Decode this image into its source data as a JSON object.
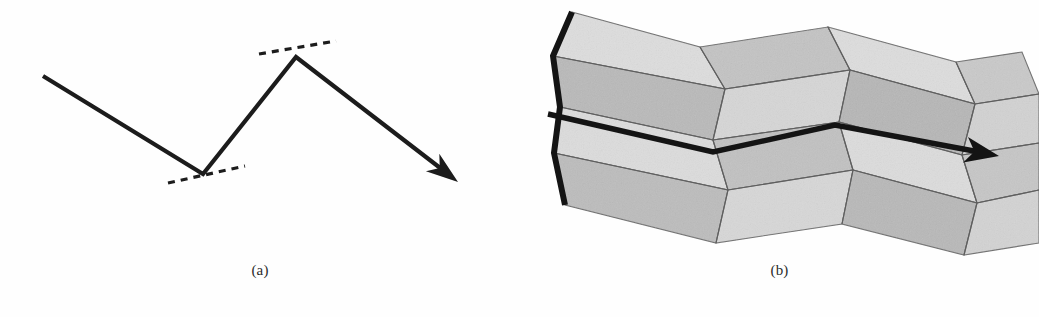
{
  "figure": {
    "kind": "two-panel line drawing",
    "background_color": "#fefefe",
    "ink_color": "#1c1c1c",
    "width": 1039,
    "height": 317
  },
  "panels": [
    {
      "id": "a",
      "caption": "(a)",
      "description": "zig-zag polyline with dashed tangent marks at the two fold vertices and an arrowhead at the right end",
      "stroke_color": "#1c1c1c",
      "stroke_width": 4,
      "polyline_points": "43,76 203,174 296,57 452,177",
      "vertices": [
        {
          "name": "start",
          "x": 43,
          "y": 76
        },
        {
          "name": "valley-fold",
          "x": 203,
          "y": 174
        },
        {
          "name": "mountain-fold",
          "x": 296,
          "y": 57
        },
        {
          "name": "arrow-tip",
          "x": 458,
          "y": 182
        }
      ],
      "dashed_marks": [
        {
          "name": "valley-tangent",
          "x1": 168,
          "y1": 182,
          "x2": 242,
          "y2": 167,
          "dash": "7 6"
        },
        {
          "name": "peak-tangent",
          "x1": 261,
          "y1": 53,
          "x2": 334,
          "y2": 42,
          "dash": "7 6"
        }
      ],
      "arrowhead": {
        "length": 30,
        "half_width": 11
      }
    },
    {
      "id": "b",
      "caption": "(b)",
      "description": "shaded Miura-ori folded sheet, four rows of parallelogram facets, bold zig-zag crease on the left edge and a bold folded arrow running left to right through the middle",
      "facet_fill_light": "#dcdcdc",
      "facet_fill_mid": "#cacaca",
      "facet_fill_dark": "#b4b4b4",
      "facet_stroke": "#6d6d6d",
      "facet_stroke_width": 1.1,
      "bold_line_color": "#141414",
      "bold_line_width": 6,
      "left_zigzag_points": "572,12 553,67 576,114 553,152 575,210",
      "middle_arrow_points": "548,114 708,152 835,125 990,155",
      "middle_arrow_tip": {
        "x": 997,
        "y": 156
      },
      "grid_columns": [
        572,
        700,
        828,
        956,
        1022
      ],
      "row_baselines": [
        12,
        67,
        114,
        152,
        210,
        258
      ]
    }
  ],
  "colors": {
    "ink": "#1c1c1c",
    "page": "#fefefe",
    "facet_light": "#dcdcdc",
    "facet_mid": "#c8c8c8",
    "facet_dark": "#b2b2b2",
    "crease": "#6d6d6d"
  }
}
